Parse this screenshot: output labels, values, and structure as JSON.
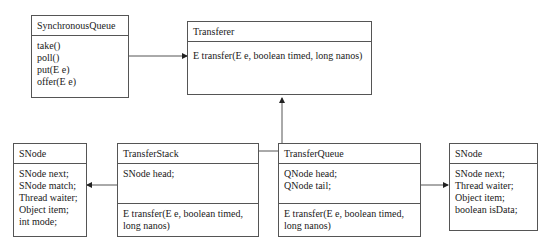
{
  "classes": {
    "synchronous_queue": {
      "name": "SynchronousQueue",
      "methods": [
        "take()",
        "poll()",
        "put(E e)",
        "offer(E e)"
      ]
    },
    "transferer": {
      "name": "Transferer",
      "methods": [
        "E transfer(E e, boolean timed, long nanos)"
      ]
    },
    "snode_left": {
      "name": "SNode",
      "fields": [
        "SNode next;",
        "SNode match;",
        "Thread waiter;",
        "Object item;",
        "int mode;"
      ]
    },
    "transfer_stack": {
      "name": "TransferStack",
      "fields": [
        "SNode head;"
      ],
      "methods": [
        "E transfer(E e, boolean timed,",
        "long nanos)"
      ]
    },
    "transfer_queue": {
      "name": "TransferQueue",
      "fields": [
        "QNode head;",
        "QNode tail;"
      ],
      "methods": [
        "E transfer(E e, boolean timed,",
        "long nanos)"
      ]
    },
    "snode_right": {
      "name": "SNode",
      "fields": [
        "SNode next;",
        "Thread waiter;",
        "Object item;",
        "boolean isData;"
      ]
    }
  },
  "relations": [
    {
      "from": "SynchronousQueue",
      "to": "Transferer",
      "type": "association"
    },
    {
      "from": "TransferStack",
      "to": "Transferer",
      "type": "inheritance"
    },
    {
      "from": "TransferQueue",
      "to": "Transferer",
      "type": "inheritance"
    },
    {
      "from": "TransferStack",
      "to": "SNode",
      "type": "association"
    },
    {
      "from": "TransferQueue",
      "to": "SNode",
      "type": "association"
    }
  ],
  "colors": {
    "border": "#555555",
    "text": "#1a1a1a",
    "background": "#ffffff"
  }
}
